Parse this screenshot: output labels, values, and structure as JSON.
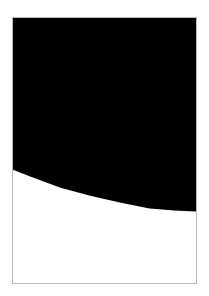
{
  "image": {
    "description": "Framed rectangle with black upper region and white lower region separated by a descending curve",
    "colors": {
      "background": "#ffffff",
      "frame_border": "#b8b8b8",
      "upper_fill": "#000000",
      "lower_fill": "#ffffff"
    },
    "frame": {
      "x": 12,
      "y": 17,
      "width": 185,
      "height": 267
    },
    "curve_points": [
      [
        0,
        153
      ],
      [
        18,
        160
      ],
      [
        48,
        171
      ],
      [
        78,
        179
      ],
      [
        108,
        186
      ],
      [
        138,
        192
      ],
      [
        163,
        194
      ],
      [
        185,
        195
      ]
    ]
  }
}
